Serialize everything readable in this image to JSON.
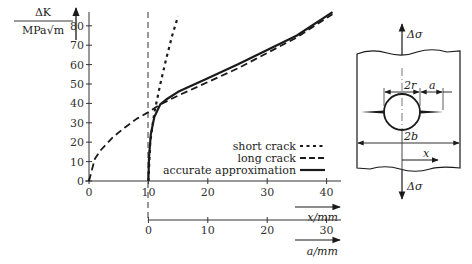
{
  "chart_data": {
    "type": "line",
    "title": "",
    "ylabel": "ΔK / MPa√m",
    "ylabel_numerator": "ΔK",
    "ylabel_denominator": "MPa√m",
    "xlabel": "x/mm",
    "x2label": "a/mm",
    "xlim": [
      0,
      42
    ],
    "ylim": [
      0,
      88
    ],
    "x_ticks": [
      0,
      10,
      20,
      30,
      40
    ],
    "x2_ticks": [
      0,
      10,
      20,
      30
    ],
    "x2_offset": 10,
    "y_ticks": [
      0,
      10,
      20,
      30,
      40,
      50,
      60,
      70,
      80
    ],
    "grid": false,
    "legend_position": "lower right",
    "series": [
      {
        "name": "short crack",
        "style": "dotted",
        "x": [
          10,
          10.3,
          11,
          12,
          13,
          14,
          15
        ],
        "y": [
          0,
          20,
          35,
          50,
          63,
          75,
          85
        ]
      },
      {
        "name": "long crack",
        "style": "dashed",
        "x": [
          0,
          1,
          2,
          4,
          6,
          8,
          10,
          12,
          15,
          20,
          25,
          30,
          35,
          41
        ],
        "y": [
          0,
          11.5,
          16,
          22.5,
          27.5,
          32,
          35.5,
          39.5,
          44,
          51,
          58,
          66,
          74,
          86
        ]
      },
      {
        "name": "accurate approximation",
        "style": "solid",
        "x": [
          10,
          10.1,
          10.4,
          11,
          12,
          13,
          15,
          20,
          25,
          30,
          35,
          41
        ],
        "y": [
          0,
          12,
          24,
          33,
          39.5,
          42,
          46,
          53,
          60,
          67.5,
          75,
          87
        ]
      }
    ],
    "vertical_reference_line": {
      "x": 10,
      "style": "dashed"
    }
  },
  "diagram": {
    "load_top": "Δσ",
    "load_bottom": "Δσ",
    "hole_diameter_label": "2r",
    "crack_length_label": "a",
    "plate_width_label": "2b",
    "x_axis_label": "x"
  }
}
